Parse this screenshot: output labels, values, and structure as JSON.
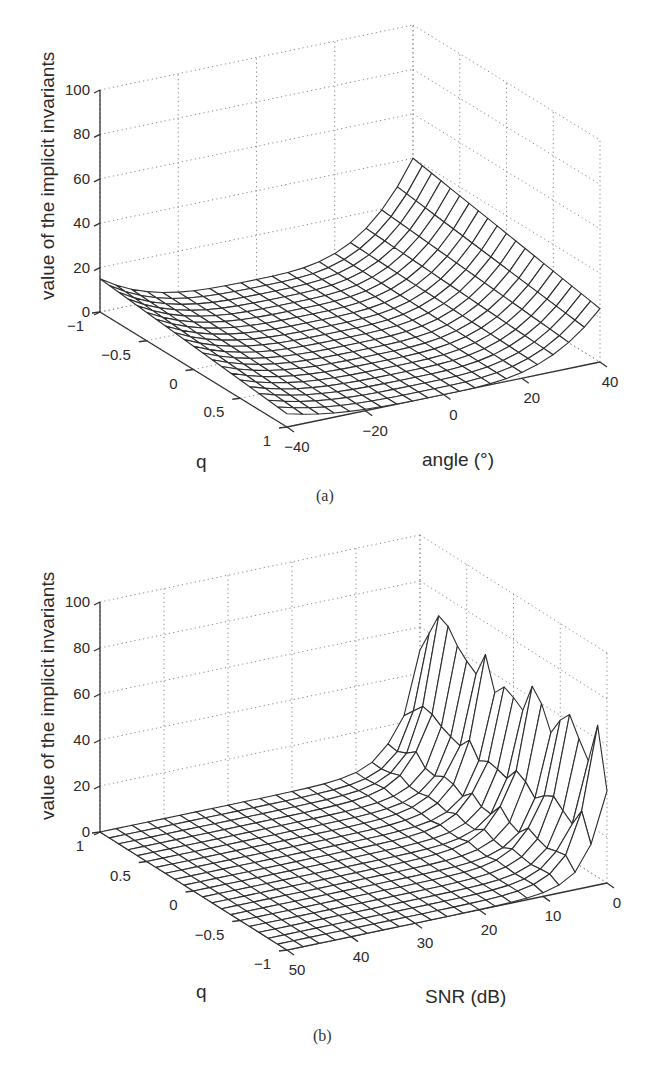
{
  "figures": [
    {
      "caption": "(a)",
      "zlabel": "value of the implicit invariants",
      "xlabel": "angle (°)",
      "ylabel": "q",
      "z_ticks": [
        "0",
        "20",
        "40",
        "60",
        "80",
        "100"
      ],
      "q_ticks": [
        "−1",
        "−0.5",
        "0",
        "0.5",
        "1"
      ],
      "x_ticks": [
        "−40",
        "−20",
        "0",
        "20",
        "40"
      ]
    },
    {
      "caption": "(b)",
      "zlabel": "value of the implicit invariants",
      "xlabel": "SNR (dB)",
      "ylabel": "q",
      "z_ticks": [
        "0",
        "20",
        "40",
        "60",
        "80",
        "100"
      ],
      "q_ticks": [
        "1",
        "0.5",
        "0",
        "−0.5",
        "−1"
      ],
      "x_ticks": [
        "50",
        "40",
        "30",
        "20",
        "10",
        "0"
      ]
    }
  ],
  "chart_data": [
    {
      "type": "surface",
      "title": "(a)",
      "xlabel": "angle (°)",
      "ylabel": "q",
      "zlabel": "value of the implicit invariants",
      "x_range": [
        -40,
        40
      ],
      "y_range": [
        -1,
        1
      ],
      "zlim": [
        0,
        100
      ],
      "x_ticks": [
        -40,
        -20,
        0,
        20,
        40
      ],
      "y_ticks": [
        -1,
        -0.5,
        0,
        0.5,
        1
      ],
      "z_ticks": [
        0,
        20,
        40,
        60,
        80,
        100
      ],
      "grid": true,
      "mesh_resolution": [
        21,
        21
      ],
      "description": "Bowl-shaped surface: near 0 around angle 0; rises toward ±40°. At angle=+40 values reach ~40 for q=-1 and ~25 for q=1; at angle=-40 values ~15 at q=-1 and ~5 at q=1.",
      "edge_profiles": {
        "angle_at_q_-1": {
          "x": [
            -40,
            -20,
            0,
            20,
            30,
            40
          ],
          "z": [
            15,
            3,
            0,
            5,
            15,
            40
          ]
        },
        "angle_at_q_1": {
          "x": [
            -40,
            -20,
            0,
            20,
            30,
            40
          ],
          "z": [
            6,
            1,
            0,
            3,
            9,
            24
          ]
        }
      }
    },
    {
      "type": "surface",
      "title": "(b)",
      "xlabel": "SNR (dB)",
      "ylabel": "q",
      "zlabel": "value of the implicit invariants",
      "x_range": [
        0,
        50
      ],
      "y_range": [
        -1,
        1
      ],
      "zlim": [
        0,
        100
      ],
      "x_ticks": [
        50,
        40,
        30,
        20,
        10,
        0
      ],
      "y_ticks": [
        1,
        0.5,
        0,
        -0.5,
        -1
      ],
      "z_ticks": [
        0,
        20,
        40,
        60,
        80,
        100
      ],
      "grid": true,
      "mesh_resolution": [
        21,
        21
      ],
      "description": "Surface flat near 0 for SNR > 15 dB; rises sharply as SNR → 0 dB, with noisy peaks of ~55–70 along the SNR=0 edge.",
      "edge_profiles": {
        "q_at_snr_0": {
          "q": [
            1,
            0.8,
            0.6,
            0.5,
            0.3,
            0.1,
            0,
            -0.2,
            -0.4,
            -0.5,
            -0.7,
            -0.8,
            -0.9,
            -1
          ],
          "z": [
            50,
            60,
            70,
            68,
            62,
            58,
            55,
            66,
            52,
            57,
            55,
            52,
            65,
            40
          ]
        },
        "snr_at_q_0": {
          "x": [
            50,
            40,
            30,
            20,
            15,
            10,
            5,
            2.5,
            0
          ],
          "z": [
            0,
            0,
            0,
            1,
            2,
            5,
            12,
            25,
            55
          ]
        }
      }
    }
  ]
}
